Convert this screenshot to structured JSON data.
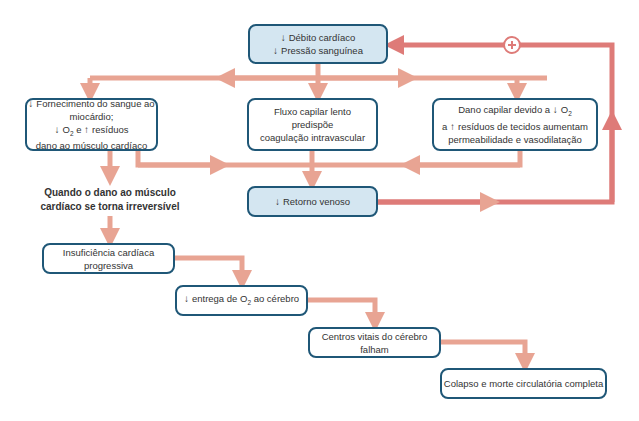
{
  "colors": {
    "arrow": "#e8a493",
    "feedback_arrow": "#de7b78",
    "box_border": "#1f5777",
    "box_blue_fill": "#d4e6f1",
    "box_white_fill": "#ffffff"
  },
  "icons": {
    "down_arrow": "↓",
    "up_arrow": "↑",
    "plus": "+"
  },
  "nodes": {
    "top": {
      "line1": "Débito cardíaco",
      "line2": "Pressão sanguínea"
    },
    "left": {
      "line1": "Fornecimento do sangue ao miocárdio;",
      "line2_o2": "O",
      "line2_sub": "2",
      "line2_mid": "e",
      "line2_end": "resíduos",
      "line3": "dano ao músculo cardíaco"
    },
    "center": {
      "line1": "Fluxo capilar lento",
      "line2": "predispõe",
      "line3": "coagulação intravascular"
    },
    "right": {
      "line1": "Dano capilar devido a",
      "line1_o2": "O",
      "line1_sub": "2",
      "line2_start": "a",
      "line2_end": "resíduos de tecidos aumentam",
      "line3": "permeabilidade e vasodilatação"
    },
    "venous": {
      "label": "Retorno venoso"
    },
    "irreversible_note": {
      "line1": "Quando o dano ao músculo",
      "line2": "cardíaco se torna irreversível"
    },
    "heart_failure": {
      "label": "Insuficiência cardíaca progressiva"
    },
    "o2_delivery": {
      "start": "entrega de O",
      "sub": "2",
      "end": "ao cérebro"
    },
    "brain_fail": {
      "label": "Centros vitais do cérebro falham"
    },
    "collapse": {
      "label": "Colapso e morte circulatória completa"
    }
  },
  "feedback": {
    "symbol": "+"
  }
}
